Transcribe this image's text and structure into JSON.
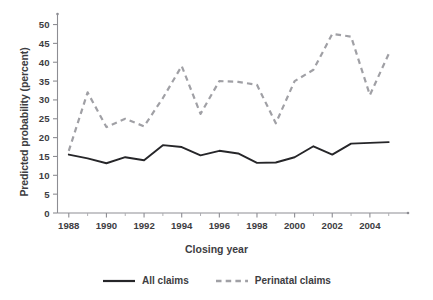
{
  "chart_data": {
    "type": "line",
    "title": "",
    "subtitle": "",
    "xlabel": "Closing year",
    "ylabel": "Predicted probability (percent)",
    "x": [
      1988,
      1989,
      1990,
      1991,
      1992,
      1993,
      1994,
      1995,
      1996,
      1997,
      1998,
      1999,
      2000,
      2001,
      2002,
      2003,
      2004,
      2005
    ],
    "xlim": [
      1987.4,
      2005.6
    ],
    "ylim": [
      0,
      52
    ],
    "yticks": [
      0,
      5,
      10,
      15,
      20,
      25,
      30,
      35,
      40,
      45,
      50
    ],
    "ytick_labels": [
      "0",
      "5",
      "10",
      "15",
      "20",
      "25",
      "30",
      "35",
      "40",
      "45",
      "50"
    ],
    "xticks": [
      1988,
      1990,
      1992,
      1994,
      1996,
      1998,
      2000,
      2002,
      2004
    ],
    "xtick_labels": [
      "1988",
      "1990",
      "1992",
      "1994",
      "1996",
      "1998",
      "2000",
      "2002",
      "2004"
    ],
    "xminor_ticks": [
      1989,
      1991,
      1993,
      1995,
      1997,
      1999,
      2001,
      2003,
      2005
    ],
    "grid": false,
    "legend_position": "bottom-center",
    "series": [
      {
        "name": "All claims",
        "style": "solid",
        "color": "#262629",
        "values": [
          15.5,
          14.5,
          13.2,
          14.8,
          14.0,
          18.0,
          17.5,
          15.3,
          16.5,
          15.8,
          13.3,
          13.4,
          14.8,
          17.7,
          15.5,
          18.4,
          18.6,
          18.8
        ]
      },
      {
        "name": "Perinatal claims",
        "style": "dashed",
        "color": "#a0a0a5",
        "values": [
          16.5,
          32.0,
          22.8,
          25.0,
          23.0,
          30.5,
          39.0,
          26.3,
          35.0,
          34.8,
          34.0,
          23.8,
          35.0,
          38.0,
          47.5,
          46.8,
          31.3,
          42.2
        ]
      }
    ]
  },
  "legend": {
    "items": [
      {
        "label": "All claims",
        "style": "solid",
        "color": "#262629"
      },
      {
        "label": "Perinatal claims",
        "style": "dashed",
        "color": "#a0a0a5"
      }
    ]
  },
  "axis": {
    "y_title": "Predicted probability (percent)",
    "x_title": "Closing year",
    "axis_color": "#8d8d93"
  }
}
